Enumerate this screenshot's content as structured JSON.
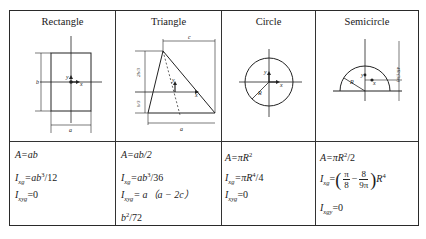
{
  "headers": [
    "Rectangle",
    "Triangle",
    "Circle",
    "Semicircle"
  ],
  "labels": {
    "rect": {
      "b": "b",
      "a": "a",
      "y": "y",
      "x": "x"
    },
    "tri": {
      "c": "c",
      "a": "a",
      "top": "2b/3",
      "bottom": "b/3",
      "y": "y",
      "x": "x"
    },
    "circle": {
      "R": "R",
      "y": "y",
      "x": "x"
    },
    "semi": {
      "R": "R",
      "h": "4R/(3π)",
      "y": "y",
      "x": "x"
    }
  },
  "formulas": {
    "rect": {
      "area_lhs": "A",
      "area_rhs": "=ab",
      "ixg_lhs": "I",
      "ixg_sub": "xg",
      "ixg_rhs_a": "=ab",
      "ixg_sup": "3",
      "ixg_rhs_b": "/12",
      "ixyg_lhs": "I",
      "ixyg_sub": "xyg",
      "ixyg_rhs": "=0"
    },
    "tri": {
      "area_lhs": "A",
      "area_rhs": "=ab/2",
      "ixg_lhs": "I",
      "ixg_sub": "xg",
      "ixg_rhs_a": "=ab",
      "ixg_sup": "3",
      "ixg_rhs_b": "/36",
      "ixyg_lhs": "I",
      "ixyg_sub": "xyg",
      "ixyg_rhs": "= a（a − 2c）",
      "ixyg_cont_a": "b",
      "ixyg_cont_sup": "2",
      "ixyg_cont_b": "/72"
    },
    "circle": {
      "area_lhs": "A",
      "area_rhs": "=πR",
      "area_sup": "2",
      "ixg_lhs": "I",
      "ixg_sub": "xg",
      "ixg_rhs_a": "=πR",
      "ixg_sup": "4",
      "ixg_rhs_b": "/4",
      "ixyg_lhs": "I",
      "ixyg_sub": "xyg",
      "ixyg_rhs": "=0"
    },
    "semi": {
      "area_lhs": "A",
      "area_rhs": "=πR",
      "area_sup": "2",
      "area_tail": "/2",
      "ixg_lhs": "I",
      "ixg_sub": "xg",
      "ixg_eq": "=",
      "frac1_num": "π",
      "frac1_den": "8",
      "minus": "−",
      "frac2_num": "8",
      "frac2_den": "9π",
      "ixg_tail": "R",
      "ixg_tail_sup": "4",
      "ixyg_lhs": "I",
      "ixyg_sub": "xgy",
      "ixyg_rhs": "=0"
    }
  }
}
